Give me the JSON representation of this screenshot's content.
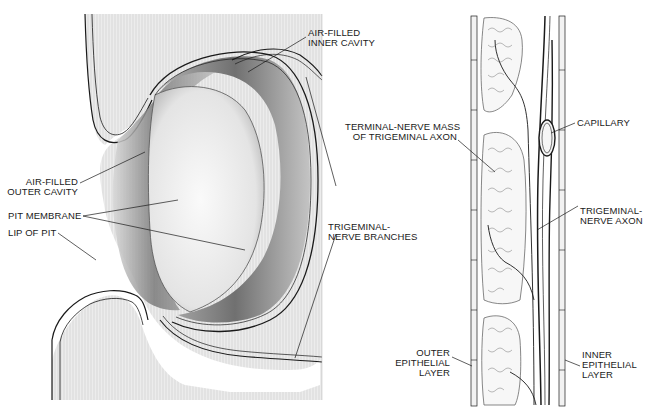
{
  "figure": {
    "left_panel": {
      "name": "pit organ cross-section",
      "labels": {
        "inner_cavity": "AIR-FILLED\nINNER CAVITY",
        "outer_cavity": "AIR-FILLED\nOUTER CAVITY",
        "pit_membrane": "PIT MEMBRANE",
        "lip_of_pit": "LIP OF PIT",
        "nerve_branches": "TRIGEMINAL-\nNERVE BRANCHES"
      }
    },
    "right_panel": {
      "name": "pit membrane detail",
      "labels": {
        "terminal_mass": "TERMINAL-NERVE MASS\nOF TRIGEMINAL AXON",
        "capillary": "CAPILLARY",
        "axon": "TRIGEMINAL-\nNERVE AXON",
        "outer_layer": "OUTER\nEPITHELIAL\nLAYER",
        "inner_layer": "INNER\nEPITHELIAL\nLAYER"
      }
    },
    "colors": {
      "ink": "#1a1a1a",
      "tissue": "#e6e6e6",
      "cavity_dark": "#8a8a8a",
      "membrane": "#f2f2f2",
      "background": "#ffffff"
    }
  }
}
